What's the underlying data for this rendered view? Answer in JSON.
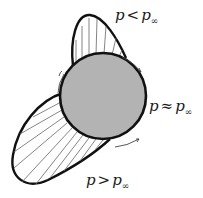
{
  "diagram": {
    "colors": {
      "body_fill": "#b3b3b3",
      "outline": "#111111",
      "arrow": "#555555",
      "background": "#ffffff"
    },
    "labels": {
      "suction": {
        "var": "p",
        "op": "<",
        "ref": "p",
        "sub": "∞"
      },
      "neutral": {
        "var": "p",
        "op": "≈",
        "ref": "p",
        "sub": "∞"
      },
      "pressure": {
        "var": "p",
        "op": ">",
        "ref": "p",
        "sub": "∞"
      }
    }
  }
}
